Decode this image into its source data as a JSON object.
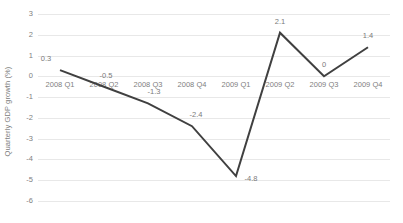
{
  "chart_data": {
    "type": "line",
    "title": "",
    "xlabel": "",
    "ylabel": "Quarterly GDP growth (%)",
    "categories": [
      "2008 Q1",
      "2008 Q2",
      "2008 Q3",
      "2008 Q4",
      "2009 Q1",
      "2009 Q2",
      "2009 Q3",
      "2009 Q4"
    ],
    "values": [
      0.3,
      -0.5,
      -1.3,
      -2.4,
      -4.8,
      2.1,
      0,
      1.4
    ],
    "point_labels": [
      "0.3",
      "-0.5",
      "-1.3",
      "-2.4",
      "-4.8",
      "2.1",
      "0",
      "1.4"
    ],
    "ylim": [
      -6,
      3
    ],
    "yticks": [
      3,
      2,
      1,
      0,
      -1,
      -2,
      -3,
      -4,
      -5,
      -6
    ],
    "ytick_labels": [
      "3",
      "2",
      "1",
      "0",
      "-1",
      "-2",
      "-3",
      "-4",
      "-5",
      "-6"
    ],
    "grid": true,
    "legend": false,
    "series_color": "#404040",
    "grid_color": "#e8e8e8",
    "text_color": "#808080",
    "background": "#ffffff"
  }
}
